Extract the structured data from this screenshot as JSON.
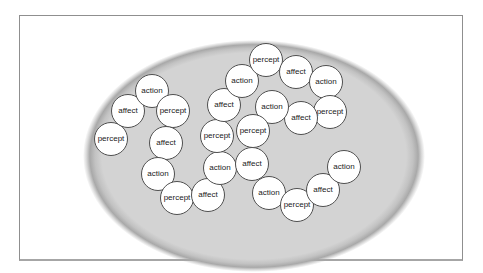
{
  "colors": {
    "page_bg": "#ffffff",
    "frame_border": "#8f8f8f",
    "frame_bottom_border": "#a6a6a6",
    "ellipse_fill": "#d3d3d3",
    "ellipse_edge": "#a9a9a9",
    "node_fill": "#ffffff",
    "node_border": "#4f4f4f",
    "node_text": "#1a1a1a"
  },
  "diagram": {
    "node_labels_cycle": [
      "percept",
      "affect",
      "action"
    ],
    "node_diameter": 34,
    "nodes": [
      {
        "label": "percept",
        "x": 111,
        "y": 139
      },
      {
        "label": "affect",
        "x": 128,
        "y": 111
      },
      {
        "label": "action",
        "x": 152,
        "y": 91
      },
      {
        "label": "percept",
        "x": 173,
        "y": 111
      },
      {
        "label": "affect",
        "x": 166,
        "y": 143
      },
      {
        "label": "action",
        "x": 158,
        "y": 174
      },
      {
        "label": "percept",
        "x": 177,
        "y": 198
      },
      {
        "label": "affect",
        "x": 208,
        "y": 195
      },
      {
        "label": "action",
        "x": 220,
        "y": 168
      },
      {
        "label": "percept",
        "x": 217,
        "y": 136
      },
      {
        "label": "affect",
        "x": 224,
        "y": 105
      },
      {
        "label": "action",
        "x": 242,
        "y": 81
      },
      {
        "label": "percept",
        "x": 266,
        "y": 60
      },
      {
        "label": "affect",
        "x": 296,
        "y": 72
      },
      {
        "label": "action",
        "x": 326,
        "y": 82
      },
      {
        "label": "percept",
        "x": 330,
        "y": 112
      },
      {
        "label": "affect",
        "x": 301,
        "y": 118
      },
      {
        "label": "action",
        "x": 272,
        "y": 107
      },
      {
        "label": "percept",
        "x": 253,
        "y": 131
      },
      {
        "label": "affect",
        "x": 252,
        "y": 164
      },
      {
        "label": "action",
        "x": 269,
        "y": 193
      },
      {
        "label": "percept",
        "x": 297,
        "y": 205
      },
      {
        "label": "affect",
        "x": 323,
        "y": 190
      },
      {
        "label": "action",
        "x": 344,
        "y": 167
      }
    ]
  }
}
